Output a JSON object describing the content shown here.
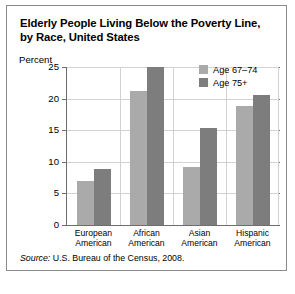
{
  "figure": {
    "title_line1": "Elderly People Living Below the Poverty Line,",
    "title_line2": "by Race, United States",
    "source_prefix": "Source:",
    "source_text": "U.S. Bureau of the Census, 2008."
  },
  "legend": {
    "position": "top-right",
    "items": [
      {
        "label": "Age 67–74",
        "color": "#aaaaaa"
      },
      {
        "label": "Age 75+",
        "color": "#7d7d7d"
      }
    ]
  },
  "axis": {
    "y_caption": "Percent",
    "y_ticks": [
      "0",
      "5",
      "10",
      "15",
      "20",
      "25"
    ]
  },
  "chart_data": {
    "type": "bar",
    "title": "Elderly People Living Below the Poverty Line, by Race, United States",
    "xlabel": "",
    "ylabel": "Percent",
    "ylim": [
      0,
      25
    ],
    "yticks": [
      0,
      5,
      10,
      15,
      20,
      25
    ],
    "grid": true,
    "legend_position": "top-right",
    "categories": [
      "European American",
      "African American",
      "Asian American",
      "Hispanic American"
    ],
    "category_lines": [
      [
        "European",
        "American"
      ],
      [
        "African",
        "American"
      ],
      [
        "Asian",
        "American"
      ],
      [
        "Hispanic",
        "American"
      ]
    ],
    "series": [
      {
        "name": "Age 67–74",
        "color": "#aaaaaa",
        "values": [
          7.0,
          21.2,
          9.2,
          18.8
        ]
      },
      {
        "name": "Age 75+",
        "color": "#7d7d7d",
        "values": [
          8.9,
          25.0,
          15.3,
          20.5
        ]
      }
    ],
    "annotations": [
      "Source: U.S. Bureau of the Census, 2008."
    ]
  },
  "scrollbar": {
    "orientation": "horizontal"
  }
}
